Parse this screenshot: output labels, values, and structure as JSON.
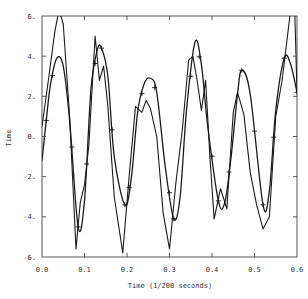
{
  "chart_data": {
    "type": "line",
    "title": "",
    "xlabel": "Time (1/200 seconds)",
    "ylabel": "Time",
    "xlim": [
      0.0,
      0.6
    ],
    "ylim": [
      -6,
      6
    ],
    "xticks": [
      "0.0",
      "0.1",
      "0.2",
      "0.3",
      "0.4",
      "0.5",
      "0.6"
    ],
    "yticks": [
      "6.",
      "4.",
      "2.",
      "0.",
      "-2.",
      "-4.",
      "-6."
    ],
    "grid": false,
    "legend": null,
    "series": [
      {
        "name": "smooth fit (with + markers)",
        "marker": "+",
        "x": [
          0.0,
          0.01,
          0.02,
          0.035,
          0.05,
          0.065,
          0.085,
          0.1,
          0.115,
          0.13,
          0.14,
          0.155,
          0.17,
          0.195,
          0.21,
          0.225,
          0.24,
          0.255,
          0.27,
          0.29,
          0.31,
          0.325,
          0.34,
          0.36,
          0.375,
          0.39,
          0.415,
          0.43,
          0.445,
          0.46,
          0.47,
          0.49,
          0.52,
          0.535,
          0.55,
          0.57,
          0.585,
          0.6
        ],
        "y": [
          -1.2,
          0.8,
          2.6,
          3.9,
          3.5,
          0.8,
          -4.5,
          -3.2,
          2.3,
          4.3,
          4.4,
          3.0,
          -1.0,
          -3.4,
          -2.1,
          1.2,
          2.6,
          2.9,
          2.2,
          -1.5,
          -4.1,
          -3.0,
          1.3,
          4.7,
          3.6,
          0.5,
          -3.2,
          -3.3,
          -1.0,
          2.1,
          3.3,
          2.1,
          -3.4,
          -2.7,
          1.3,
          3.9,
          3.6,
          2.2
        ],
        "marker_x": [
          0.01,
          0.025,
          0.07,
          0.085,
          0.105,
          0.125,
          0.14,
          0.165,
          0.195,
          0.205,
          0.235,
          0.265,
          0.3,
          0.31,
          0.35,
          0.37,
          0.4,
          0.415,
          0.44,
          0.47,
          0.5,
          0.52,
          0.545,
          0.57,
          0.6
        ]
      },
      {
        "name": "raw signal",
        "marker": "none",
        "x": [
          0.0,
          0.015,
          0.03,
          0.04,
          0.05,
          0.065,
          0.08,
          0.09,
          0.1,
          0.11,
          0.125,
          0.135,
          0.145,
          0.155,
          0.17,
          0.19,
          0.205,
          0.22,
          0.235,
          0.245,
          0.255,
          0.27,
          0.285,
          0.3,
          0.315,
          0.33,
          0.345,
          0.355,
          0.365,
          0.375,
          0.385,
          0.395,
          0.405,
          0.42,
          0.435,
          0.45,
          0.46,
          0.475,
          0.49,
          0.505,
          0.52,
          0.535,
          0.55,
          0.565,
          0.585,
          0.595,
          0.6
        ],
        "y": [
          0.5,
          2.8,
          5.2,
          6.3,
          5.6,
          1.0,
          -5.6,
          -3.3,
          -2.4,
          -0.5,
          5.0,
          2.8,
          3.5,
          1.5,
          -3.0,
          -5.8,
          -2.0,
          1.5,
          1.2,
          1.8,
          1.4,
          0.0,
          -3.8,
          -5.6,
          -2.3,
          0.3,
          3.8,
          4.0,
          2.8,
          1.3,
          2.8,
          -1.0,
          -4.1,
          -2.6,
          -3.6,
          1.2,
          2.2,
          1.1,
          -1.8,
          -3.4,
          -4.6,
          -4.0,
          1.0,
          2.8,
          6.3,
          6.0,
          2.2
        ]
      }
    ]
  }
}
